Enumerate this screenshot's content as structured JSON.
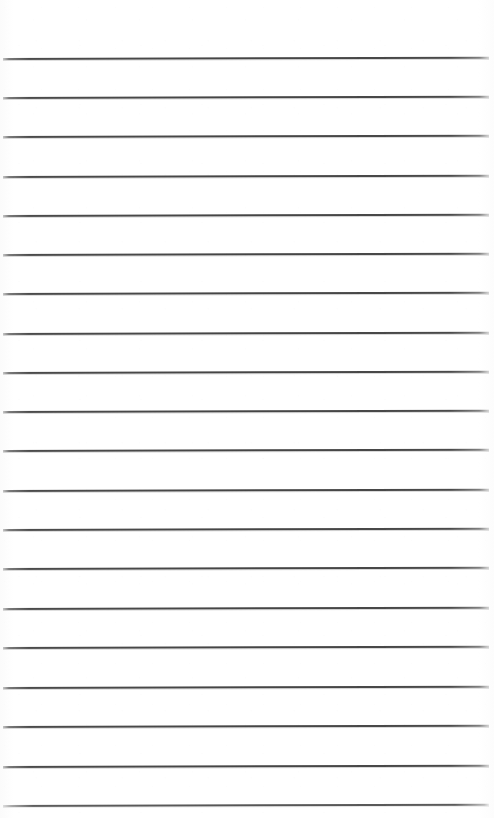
{
  "document": {
    "kind": "scanned-lined-paper",
    "title": "Lined Paper",
    "page_width": 494,
    "page_height": 818,
    "background_color": "#ffffff",
    "rule_color": "#4a4a4a",
    "rule_thickness_px": 1.6,
    "rule_left_x": 3,
    "rule_right_x": 489,
    "rule_count": 20,
    "rule_spacing_px": 39.3,
    "first_rule_y": 58,
    "last_rule_y": 805,
    "tilt_degrees": -0.16,
    "written_text": "",
    "margin_rule": "none",
    "ruling_style": "wide-ruled-horizontal-only"
  },
  "rules": [
    {
      "index": 1,
      "y": 58,
      "faint": false
    },
    {
      "index": 2,
      "y": 97,
      "faint": false
    },
    {
      "index": 3,
      "y": 136,
      "faint": false
    },
    {
      "index": 4,
      "y": 176,
      "faint": false
    },
    {
      "index": 5,
      "y": 215,
      "faint": false
    },
    {
      "index": 6,
      "y": 254,
      "faint": false
    },
    {
      "index": 7,
      "y": 293,
      "faint": false
    },
    {
      "index": 8,
      "y": 333,
      "faint": false
    },
    {
      "index": 9,
      "y": 372,
      "faint": false
    },
    {
      "index": 10,
      "y": 411,
      "faint": false
    },
    {
      "index": 11,
      "y": 450,
      "faint": false
    },
    {
      "index": 12,
      "y": 490,
      "faint": false
    },
    {
      "index": 13,
      "y": 529,
      "faint": false
    },
    {
      "index": 14,
      "y": 568,
      "faint": false
    },
    {
      "index": 15,
      "y": 608,
      "faint": false
    },
    {
      "index": 16,
      "y": 647,
      "faint": false
    },
    {
      "index": 17,
      "y": 687,
      "faint": false
    },
    {
      "index": 18,
      "y": 726,
      "faint": false
    },
    {
      "index": 19,
      "y": 766,
      "faint": false
    },
    {
      "index": 20,
      "y": 805,
      "faint": true
    }
  ]
}
